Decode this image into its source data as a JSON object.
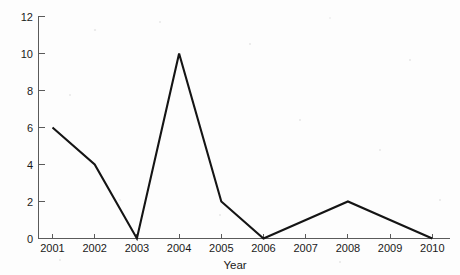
{
  "chart_data": {
    "type": "line",
    "title": "",
    "xlabel": "Year",
    "ylabel": "",
    "categories": [
      "2001",
      "2002",
      "2003",
      "2004",
      "2005",
      "2006",
      "2007",
      "2008",
      "2009",
      "2010"
    ],
    "values": [
      6,
      4,
      0,
      10,
      2,
      0,
      1,
      2,
      1,
      0
    ],
    "series": [
      {
        "name": "",
        "values": [
          6,
          4,
          0,
          10,
          2,
          0,
          1,
          2,
          1,
          0
        ]
      }
    ],
    "x": [
      2001,
      2002,
      2003,
      2004,
      2005,
      2006,
      2007,
      2008,
      2009,
      2010
    ],
    "ylim": [
      0,
      12
    ],
    "xlim": [
      2001,
      2010
    ],
    "y_ticks": [
      "0",
      "2",
      "4",
      "6",
      "8",
      "10",
      "12"
    ],
    "y_tick_values": [
      0,
      2,
      4,
      6,
      8,
      10,
      12
    ],
    "x_ticks": [
      "2001",
      "2002",
      "2003",
      "2004",
      "2005",
      "2006",
      "2007",
      "2008",
      "2009",
      "2010"
    ],
    "grid": false,
    "legend": false,
    "legend_position": "none",
    "markers": false,
    "line_color": "#141414",
    "axis_color": "#5a5a5a",
    "background_color": "#fdfdfd",
    "annotations": []
  },
  "axes": {
    "y_axis_name": "y-axis",
    "x_axis_name": "x-axis",
    "x_title": "Year"
  }
}
